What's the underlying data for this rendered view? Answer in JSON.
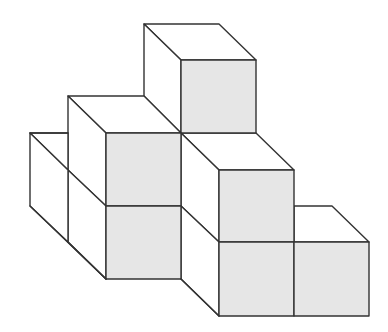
{
  "figure": {
    "colors": {
      "front_face": "#e6e6e6",
      "top_side_face": "#ffffff",
      "edge": "#333333",
      "background": "#ffffff"
    },
    "cube_count_visible": 8,
    "front_faces": [
      {
        "id": "top-cube-front",
        "x": 181,
        "y": 60,
        "w": 75,
        "h": 73
      },
      {
        "id": "upper-left-front",
        "x": 106,
        "y": 133,
        "w": 75,
        "h": 73
      },
      {
        "id": "lower-left-front",
        "x": 106,
        "y": 206,
        "w": 75,
        "h": 73
      },
      {
        "id": "middle-right-front",
        "x": 219,
        "y": 170,
        "w": 75,
        "h": 72
      },
      {
        "id": "bottom-middle-front",
        "x": 219,
        "y": 242,
        "w": 75,
        "h": 74
      },
      {
        "id": "bottom-right-front",
        "x": 294,
        "y": 242,
        "w": 75,
        "h": 74
      }
    ]
  }
}
